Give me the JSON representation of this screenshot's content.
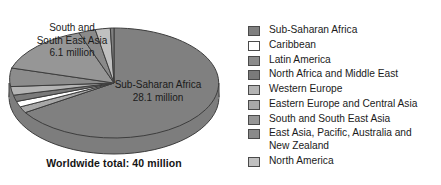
{
  "figure": {
    "caption": "Worldwide total: 40 million",
    "units": "million"
  },
  "labels": {
    "ssea": "South and\nSouth East Asia\n6.1 million",
    "ssea_line1": "South and",
    "ssea_line2": "South East Asia",
    "ssea_line3": "6.1 million",
    "ssa_line1": "Sub-Saharan Africa",
    "ssa_line2": "28.1 million"
  },
  "legend": {
    "position": "right",
    "items": [
      {
        "label": "Sub-Saharan Africa",
        "color": "#808080"
      },
      {
        "label": "Caribbean",
        "color": "#ffffff"
      },
      {
        "label": "Latin America",
        "color": "#8c8c8c"
      },
      {
        "label": "North Africa and Middle East",
        "color": "#7a7a7a"
      },
      {
        "label": "Western Europe",
        "color": "#b4b4b4"
      },
      {
        "label": "Eastern Europe and Central Asia",
        "color": "#a8a8a8"
      },
      {
        "label": "South and South East Asia",
        "color": "#969696"
      },
      {
        "label": "East Asia, Pacific, Australia and\nNew Zealand",
        "color": "#8a8a8a"
      },
      {
        "label": "North America",
        "color": "#c0c0c0"
      }
    ]
  },
  "chart_data": {
    "type": "pie",
    "title": "",
    "subtitle": "",
    "xlabel": "",
    "ylabel": "",
    "total": 40,
    "total_label": "Worldwide total: 40 million",
    "units": "million people",
    "three_d": true,
    "legend_position": "right",
    "grid": false,
    "categories": [
      "Sub-Saharan Africa",
      "Caribbean",
      "Latin America",
      "North Africa and Middle East",
      "Western Europe",
      "Eastern Europe and Central Asia",
      "South and South East Asia",
      "East Asia, Pacific, Australia and New Zealand",
      "North America"
    ],
    "values": [
      28.1,
      0.4,
      1.4,
      0.4,
      0.5,
      0.7,
      6.1,
      1.0,
      0.9
    ],
    "colors": [
      "#808080",
      "#ffffff",
      "#8c8c8c",
      "#7a7a7a",
      "#b4b4b4",
      "#a8a8a8",
      "#969696",
      "#8a8a8a",
      "#c0c0c0"
    ],
    "data_labels": [
      {
        "category": "Sub-Saharan Africa",
        "text": "Sub-Saharan Africa 28.1 million",
        "value": 28.1
      },
      {
        "category": "South and South East Asia",
        "text": "South and South East Asia 6.1 million",
        "value": 6.1
      }
    ],
    "annotations": [
      "Worldwide total: 40 million"
    ]
  }
}
